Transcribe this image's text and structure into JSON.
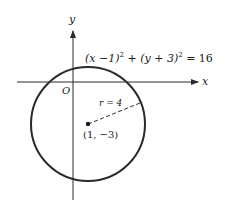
{
  "diagram": {
    "equation": {
      "part1": "(x −1)",
      "exp1": "2",
      "part2": " + (y + 3)",
      "exp2": "2",
      "part3": " = 16"
    },
    "labels": {
      "y_axis": "y",
      "x_axis": "x",
      "origin": "O",
      "radius": "r = 4",
      "center": "(1, −3)"
    },
    "circle": {
      "center": [
        1,
        -3
      ],
      "radius": 4
    },
    "colors": {
      "stroke": "#2a2a2a",
      "background": "#ffffff"
    }
  }
}
